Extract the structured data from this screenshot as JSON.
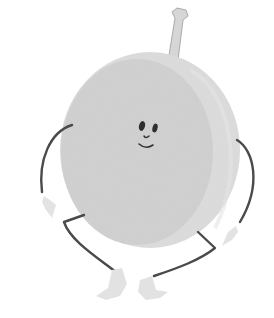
{
  "image": {
    "subject": "cartoon plum character",
    "style": "grayscale watercolor illustration",
    "colors": {
      "background": "#ffffff",
      "body_light": "#d9d9d9",
      "body_mid": "#cfcfcf",
      "body_side": "#dedede",
      "stem": "#d4d4d4",
      "stem_outline": "#a8a8a8",
      "limb_line": "#4a4a4a",
      "hand_foot": "#e2e2e2",
      "face": "#2e2e2e"
    },
    "parts": [
      "stem",
      "body",
      "face",
      "left-arm",
      "right-arm",
      "left-leg",
      "right-leg"
    ]
  }
}
